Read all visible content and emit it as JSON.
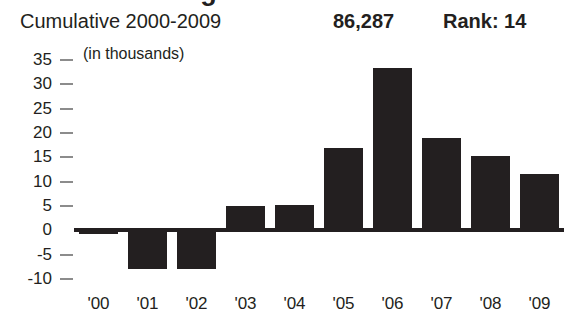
{
  "title_remnant": "Net Migration",
  "header": {
    "cumulative_label": "Cumulative 2000-2009",
    "cumulative_value": "86,287",
    "rank_label": "Rank: 14"
  },
  "chart_data": {
    "type": "bar",
    "title": "",
    "subtitle": "Cumulative 2000-2009",
    "units_note": "(in thousands)",
    "xlabel": "",
    "ylabel": "",
    "categories": [
      "'00",
      "'01",
      "'02",
      "'03",
      "'04",
      "'05",
      "'06",
      "'07",
      "'08",
      "'09"
    ],
    "values": [
      -0.8,
      -8.0,
      -8.0,
      5.0,
      5.2,
      17.0,
      33.3,
      19.0,
      15.3,
      11.5
    ],
    "ylim": [
      -10,
      35
    ],
    "yticks": [
      35,
      30,
      25,
      20,
      15,
      10,
      5,
      0,
      -5,
      -10
    ],
    "ytick_labels": [
      "35",
      "30",
      "25",
      "20",
      "15",
      "10",
      "5",
      "0",
      "-5",
      "-10"
    ],
    "grid": false,
    "legend": "none",
    "bar_color": "#231f20",
    "axis_color": "#8c8c8c",
    "zero_line_color": "#231f20"
  }
}
